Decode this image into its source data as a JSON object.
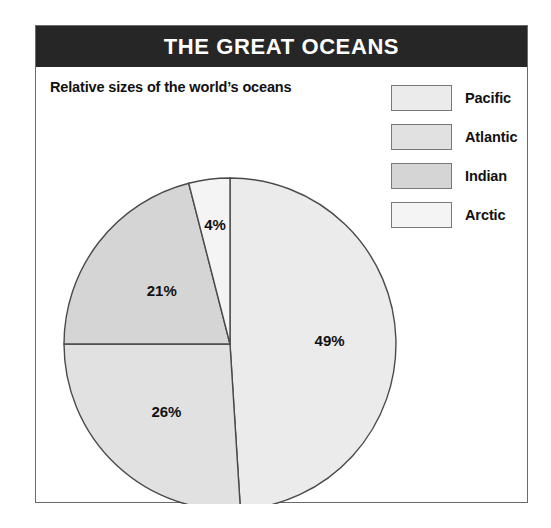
{
  "header": {
    "title": "THE GREAT OCEANS"
  },
  "subtitle": "Relative sizes of the world’s oceans",
  "legend": {
    "items": [
      {
        "label": "Pacific",
        "color": "#ebebeb"
      },
      {
        "label": "Atlantic",
        "color": "#e1e1e1"
      },
      {
        "label": "Indian",
        "color": "#d5d5d5"
      },
      {
        "label": "Arctic",
        "color": "#f4f4f4"
      }
    ]
  },
  "chart_data": {
    "type": "pie",
    "title": "THE GREAT OCEANS",
    "subtitle": "Relative sizes of the world’s oceans",
    "categories": [
      "Pacific",
      "Atlantic",
      "Indian",
      "Arctic"
    ],
    "values": [
      49,
      26,
      21,
      4
    ],
    "value_labels": [
      "49%",
      "26%",
      "21%",
      "4%"
    ],
    "unit": "percent",
    "colors": [
      "#ebebeb",
      "#e1e1e1",
      "#d5d5d5",
      "#f4f4f4"
    ],
    "start_angle_deg": 0,
    "direction": "clockwise",
    "legend_position": "top-right",
    "grid": false,
    "xlabel": "",
    "ylabel": ""
  },
  "style": {
    "header_bg": "#262626",
    "header_text": "#ffffff",
    "frame_border": "#6a6a6a",
    "slice_border": "#4a4a4a",
    "text_color": "#111111"
  }
}
